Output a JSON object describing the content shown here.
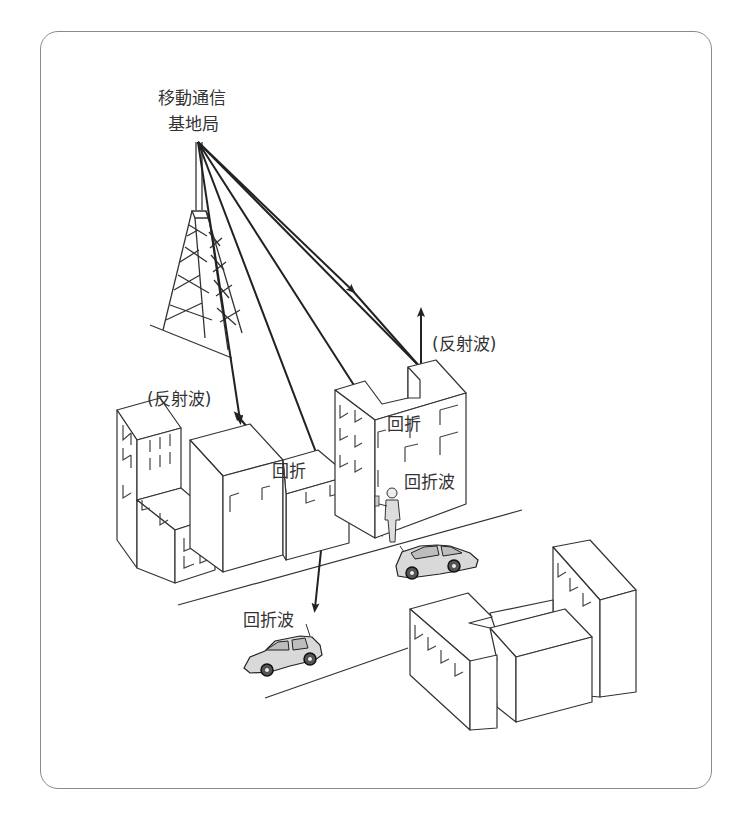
{
  "diagram": {
    "base_station_label": [
      "移動通信",
      "基地局"
    ],
    "labels": {
      "reflected_wave_right": "(反射波)",
      "reflected_wave_left": "(反射波)",
      "diffraction_center": "回折",
      "diffraction_right": "回折",
      "diffracted_wave_right": "回折波",
      "diffracted_wave_bottom": "回折波"
    },
    "elements": [
      "base-station-tower",
      "buildings-left-cluster",
      "buildings-right-cluster",
      "buildings-bottom-cluster",
      "pedestrian-with-phone",
      "car-near-pedestrian",
      "car-bottom-left",
      "roads"
    ],
    "colors": {
      "frame": "#8a8a8a",
      "lines": "#222222",
      "background": "#ffffff"
    }
  }
}
